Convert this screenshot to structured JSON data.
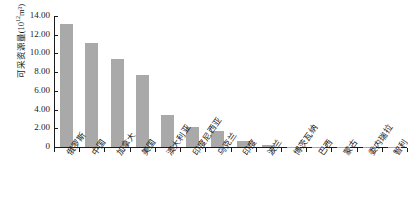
{
  "chart_data": {
    "type": "bar",
    "title": "",
    "subtitle": "",
    "xlabel": "",
    "ylabel": "可采资源量(10¹²m³)",
    "ylabel_base": "可采资源量(10",
    "ylabel_exp": "12",
    "ylabel_tail": "m³)",
    "ylim": [
      0,
      14
    ],
    "ytick_step": 2,
    "ytick_labels": [
      "14.00",
      "12.00",
      "10.00",
      "8.00",
      "6.00",
      "4.00",
      "2.00",
      "0"
    ],
    "ytick_values": [
      14,
      12,
      10,
      8,
      6,
      4,
      2,
      0
    ],
    "grid": false,
    "legend": "none",
    "bar_color": "#a9a9a9",
    "axis_color": "#1a1a1a",
    "background": "#ffffff",
    "categories": [
      "俄罗斯",
      "中国",
      "加拿大",
      "美国",
      "澳大利亚",
      "印度尼西亚",
      "乌克兰",
      "印度",
      "波兰",
      "博茨瓦纳",
      "巴西",
      "蒙古",
      "委内瑞拉",
      "智利"
    ],
    "values": [
      13.1,
      11.1,
      9.4,
      7.7,
      3.4,
      2.1,
      1.7,
      0.6,
      0.2,
      0.05,
      0.02,
      0.01,
      0.01,
      0.01
    ]
  }
}
